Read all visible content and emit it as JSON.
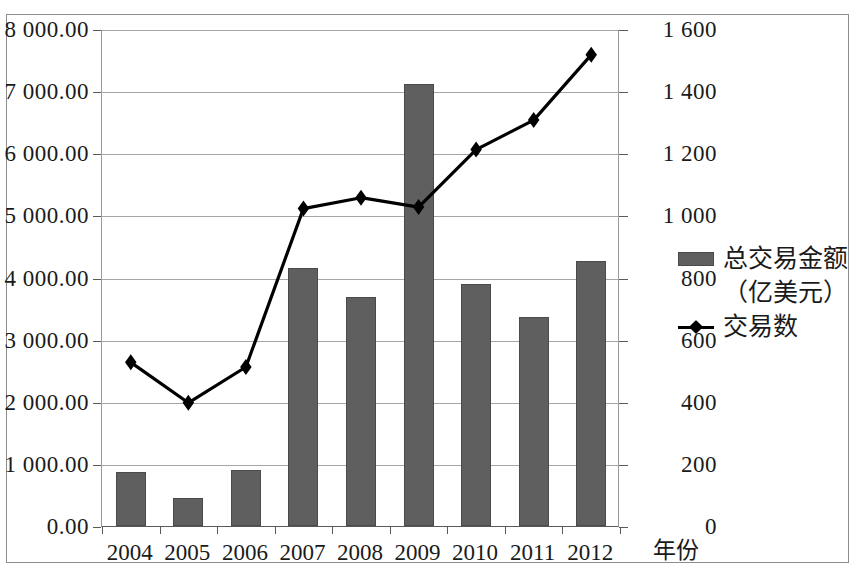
{
  "chart_data": {
    "type": "bar",
    "title": "",
    "subtitle": "",
    "xlabel": "年份",
    "ylabel_left": "",
    "ylabel_right": "",
    "grid": true,
    "legend_position": "right",
    "categories": [
      "2004",
      "2005",
      "2006",
      "2007",
      "2008",
      "2009",
      "2010",
      "2011",
      "2012"
    ],
    "left_axis": {
      "min": 0,
      "max": 8000,
      "step": 1000,
      "ticks": [
        "0.00",
        "1 000.00",
        "2 000.00",
        "3 000.00",
        "4 000.00",
        "5 000.00",
        "6 000.00",
        "7 000.00",
        "8 000.00"
      ],
      "tick_values": [
        0,
        1000,
        2000,
        3000,
        4000,
        5000,
        6000,
        7000,
        8000
      ]
    },
    "right_axis": {
      "min": 0,
      "max": 1600,
      "step": 200,
      "ticks": [
        "0",
        "200",
        "400",
        "600",
        "800",
        "1 000",
        "1 200",
        "1 400",
        "1 600"
      ],
      "tick_values": [
        0,
        200,
        400,
        600,
        800,
        1000,
        1200,
        1400,
        1600
      ]
    },
    "series": [
      {
        "name": "总交易金额（亿美元）",
        "type": "bar",
        "axis": "left",
        "color": "#5f5f5f",
        "values": [
          870,
          450,
          905,
          4160,
          3690,
          7110,
          3890,
          3370,
          4270
        ]
      },
      {
        "name": "交易数",
        "type": "line",
        "axis": "right",
        "color": "#000000",
        "marker": "diamond",
        "values": [
          530,
          400,
          515,
          1025,
          1060,
          1030,
          1215,
          1310,
          1520
        ]
      }
    ]
  },
  "legend": {
    "bar_label_line1": "总交易金额",
    "bar_label_line2": "（亿美元）",
    "line_label": "交易数"
  }
}
